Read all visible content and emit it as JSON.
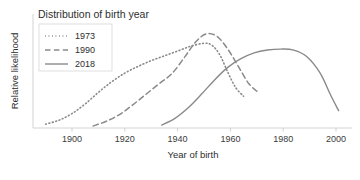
{
  "chart_data": {
    "type": "line",
    "title": "Distribution of birth year",
    "xlabel": "Year of birth",
    "ylabel": "Relative likelihood",
    "xlim": [
      1888,
      2002
    ],
    "ylim": [
      0,
      1.06
    ],
    "xticks": [
      1900,
      1920,
      1940,
      1960,
      1980,
      2000
    ],
    "xticklabels": [
      "1900",
      "1920",
      "1940",
      "1960",
      "1980",
      "2000"
    ],
    "yticks": [],
    "yticklabels": [],
    "grid": false,
    "legend_position": "upper left",
    "line_color": "#8a8a8a",
    "series": [
      {
        "name": "1973",
        "style": "dotted",
        "x": [
          1890,
          1895,
          1900,
          1905,
          1910,
          1915,
          1920,
          1925,
          1930,
          1935,
          1940,
          1945,
          1950,
          1953,
          1956,
          1959,
          1962,
          1965
        ],
        "values": [
          0.04,
          0.08,
          0.15,
          0.25,
          0.37,
          0.48,
          0.57,
          0.64,
          0.7,
          0.75,
          0.8,
          0.85,
          0.88,
          0.86,
          0.76,
          0.58,
          0.42,
          0.33
        ]
      },
      {
        "name": "1990",
        "style": "dashed",
        "x": [
          1908,
          1913,
          1918,
          1923,
          1928,
          1933,
          1938,
          1943,
          1947,
          1951,
          1955,
          1959,
          1963,
          1967,
          1971
        ],
        "values": [
          0.02,
          0.07,
          0.14,
          0.24,
          0.35,
          0.46,
          0.57,
          0.75,
          0.9,
          0.98,
          0.95,
          0.82,
          0.64,
          0.46,
          0.36
        ]
      },
      {
        "name": "2018",
        "style": "solid",
        "x": [
          1934,
          1939,
          1944,
          1949,
          1954,
          1959,
          1964,
          1969,
          1974,
          1979,
          1984,
          1989,
          1994,
          1998,
          2001
        ],
        "values": [
          0.03,
          0.1,
          0.21,
          0.35,
          0.5,
          0.63,
          0.72,
          0.78,
          0.81,
          0.82,
          0.81,
          0.74,
          0.57,
          0.34,
          0.18
        ]
      }
    ]
  }
}
